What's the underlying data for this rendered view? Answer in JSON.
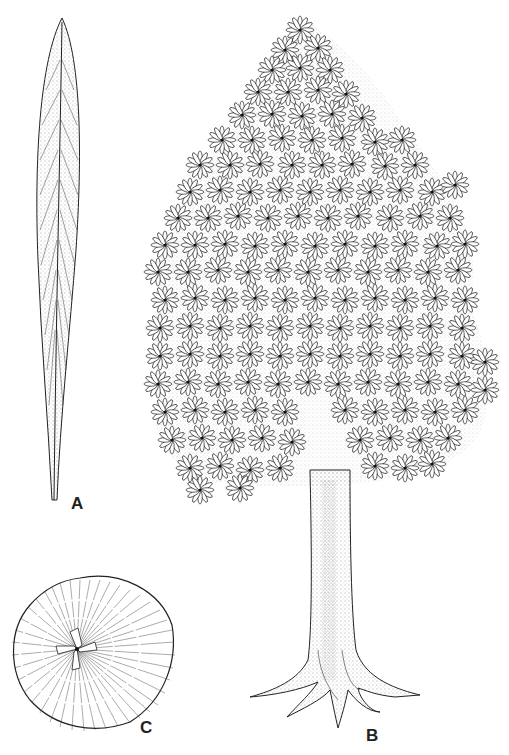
{
  "figure": {
    "panels": [
      {
        "id": "A",
        "label": "A",
        "subject": "leaf"
      },
      {
        "id": "B",
        "label": "B",
        "subject": "tree"
      },
      {
        "id": "C",
        "label": "C",
        "subject": "stem-cross-section"
      }
    ]
  },
  "colors": {
    "ink": "#222222",
    "background": "#ffffff"
  }
}
